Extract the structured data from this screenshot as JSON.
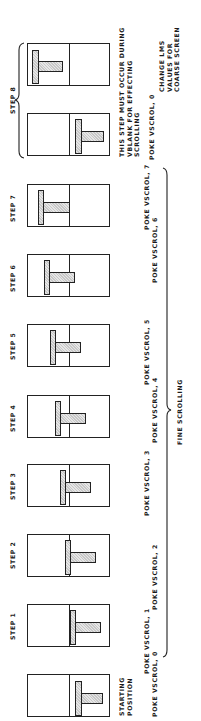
{
  "diagram": {
    "orientation": "rotated-90-ccw",
    "steps": [
      {
        "id": "start",
        "label": "STARTING POSITION",
        "label_lines": [
          "STARTING",
          "POSITION"
        ],
        "poke": "POKE  VSCROL, 0",
        "box_top": 674,
        "t_offset": 47
      },
      {
        "id": "step1",
        "label": "STEP 1",
        "poke": "POKE  VSCROL, 1",
        "box_top": 604,
        "t_offset": 42
      },
      {
        "id": "step2",
        "label": "STEP 2",
        "poke": "POKE  VSCROL, 2",
        "box_top": 534,
        "t_offset": 37
      },
      {
        "id": "step3",
        "label": "STEP 3",
        "poke": "POKE  VSCROL, 3",
        "box_top": 464,
        "t_offset": 32
      },
      {
        "id": "step4",
        "label": "STEP 4",
        "poke": "POKE  VSCROL, 4",
        "box_top": 395,
        "t_offset": 27
      },
      {
        "id": "step5",
        "label": "STEP 5",
        "poke": "POKE  VSCROL, 5",
        "box_top": 324,
        "t_offset": 22
      },
      {
        "id": "step6",
        "label": "STEP 6",
        "poke": "POKE  VSCROL, 6",
        "box_top": 254,
        "t_offset": 16
      },
      {
        "id": "step7",
        "label": "STEP 7",
        "poke": "POKE  VSCROL, 7",
        "box_top": 184,
        "t_offset": 10
      }
    ],
    "step8": {
      "label": "STEP 8",
      "boxes": [
        {
          "box_top": 113,
          "t_offset": 47
        },
        {
          "box_top": 43,
          "t_offset": 4
        }
      ],
      "note_lines": [
        "THIS  STEP  MUST  OCCUR  DURING",
        "VBLANK  FOR  EFFECTING",
        "SCROLLING"
      ],
      "poke": "POKE  VSCROL, 0",
      "lms_lines": [
        "CHANGE  LMS",
        "VALUES  FOR",
        "COARSE  SCREEN"
      ]
    },
    "fine_scrolling_label": "FINE  SCROLLING",
    "colors": {
      "line": "#222222",
      "fill": "#d4d4d4",
      "background": "#ffffff"
    }
  }
}
